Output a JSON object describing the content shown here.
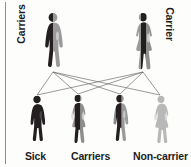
{
  "diagram": {
    "background_color": "#fdfdfc",
    "rule_color": "#8d8d8d",
    "line_color": "#6f6f6f",
    "colors": {
      "affected_dark": "#231f20",
      "carrier_gray": "#8e8e8e",
      "normal_light": "#b8b8b8",
      "text": "#1d1d1d"
    },
    "parents": [
      {
        "id": "father",
        "sex": "male",
        "label": "Carriers",
        "label_orientation": "vertical-left",
        "genotype": "heterozygous-carrier",
        "fill_left": "#231f20",
        "fill_right": "#9a9a9a"
      },
      {
        "id": "mother",
        "sex": "female",
        "label": "Carrier",
        "label_orientation": "vertical-right",
        "genotype": "heterozygous-carrier",
        "fill_left": "#9a9a9a",
        "fill_right": "#231f20"
      }
    ],
    "children": [
      {
        "id": "child-1",
        "sex": "male",
        "label": "Sick",
        "genotype": "homozygous-affected",
        "fill_left": "#231f20",
        "fill_right": "#231f20"
      },
      {
        "id": "child-2",
        "sex": "female",
        "label": "Carriers",
        "genotype": "heterozygous-carrier",
        "fill_left": "#9a9a9a",
        "fill_right": "#231f20"
      },
      {
        "id": "child-3",
        "sex": "male",
        "label": "",
        "genotype": "heterozygous-carrier",
        "fill_left": "#231f20",
        "fill_right": "#9a9a9a"
      },
      {
        "id": "child-4",
        "sex": "female",
        "label": "Non-carrier",
        "genotype": "homozygous-normal",
        "fill_left": "#b8b8b8",
        "fill_right": "#b8b8b8"
      }
    ],
    "bottom_labels": {
      "sick": "Sick",
      "carriers": "Carriers",
      "non_carrier": "Non-carrier"
    }
  }
}
